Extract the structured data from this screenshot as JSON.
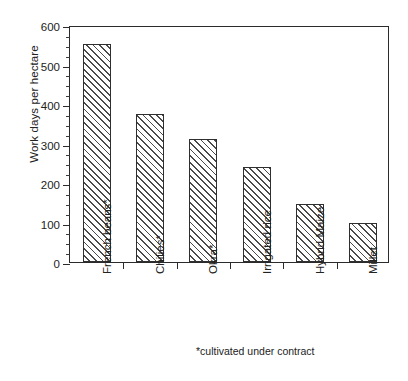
{
  "chart_data": {
    "type": "bar",
    "title": "",
    "xlabel": "",
    "ylabel": "Work days per hectare",
    "categories": [
      "French beans*",
      "Chilies*",
      "Okra*",
      "Irrigated rice",
      "Hybrid Maize",
      "Millet"
    ],
    "values": [
      553,
      375,
      312,
      240,
      148,
      100
    ],
    "ylim": [
      0,
      600
    ],
    "ytick_labels": [
      "0",
      "100",
      "200",
      "300",
      "400",
      "500",
      "600"
    ],
    "ytick_values": [
      0,
      100,
      200,
      300,
      400,
      500,
      600
    ],
    "yminor_step": 25,
    "grid": false,
    "legend": null,
    "footnote": "*cultivated under contract",
    "bar_style": {
      "fill": "hatched-diagonal",
      "hatch_color": "#4a4a4a",
      "edge_color": "#2f2f2f",
      "face_color": "#ffffff"
    }
  }
}
